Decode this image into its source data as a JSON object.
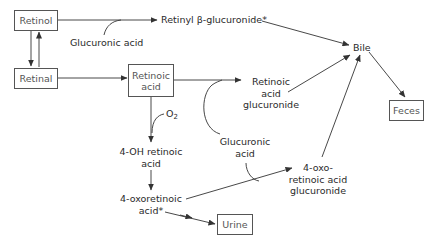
{
  "diagram": {
    "type": "metabolic pathway",
    "nodes": {
      "retinol": "Retinol",
      "retinal": "Retinal",
      "retinoic_acid_1": "Retinoic",
      "retinoic_acid_2": "acid",
      "retinyl_glucuronide": "Retinyl β-glucuronide*",
      "glucuronic_acid_top": "Glucuronic acid",
      "bile": "Bile",
      "feces": "Feces",
      "ra_gluc_1": "Retinoic",
      "ra_gluc_2": "acid",
      "ra_gluc_3": "glucuronide",
      "o2": "O",
      "o2_sub": "2",
      "oh_ra_1": "4-OH retinoic",
      "oh_ra_2": "acid",
      "gluc_acid_mid_1": "Glucuronic",
      "gluc_acid_mid_2": "acid",
      "oxo_ra_1": "4-oxoretinoic",
      "oxo_ra_2": "acid*",
      "oxo_gluc_1": "4-oxo-",
      "oxo_gluc_2": "retinoic acid",
      "oxo_gluc_3": "glucuronide",
      "urine": "Urine"
    },
    "edges": [
      [
        "Retinol",
        "Retinal"
      ],
      [
        "Retinal",
        "Retinol"
      ],
      [
        "Retinol",
        "Retinyl β-glucuronide*"
      ],
      [
        "Retinyl β-glucuronide*",
        "Bile"
      ],
      [
        "Retinal",
        "Retinoic acid"
      ],
      [
        "Retinoic acid",
        "Retinoic acid glucuronide"
      ],
      [
        "Retinoic acid glucuronide",
        "Bile"
      ],
      [
        "Retinoic acid",
        "4-OH retinoic acid"
      ],
      [
        "4-OH retinoic acid",
        "4-oxoretinoic acid*"
      ],
      [
        "4-oxoretinoic acid*",
        "4-oxo-retinoic acid glucuronide"
      ],
      [
        "4-oxoretinoic acid*",
        "Urine"
      ],
      [
        "4-oxo-retinoic acid glucuronide",
        "Bile"
      ],
      [
        "Bile",
        "Feces"
      ]
    ],
    "colors": {
      "line": "#333333",
      "box_border": "#555555",
      "text": "#2a2a2a"
    }
  }
}
